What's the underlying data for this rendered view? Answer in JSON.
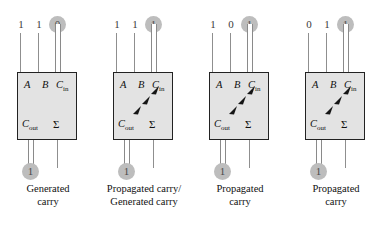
{
  "figure": {
    "colors": {
      "node_fill": "#bdbdbd",
      "box_fill": "#e3e3e3",
      "box_border": "#222222",
      "wire": "#8f8f8f",
      "text": "#111111"
    },
    "ports": {
      "a": "A",
      "b": "B",
      "cin_main": "C",
      "cin_sub": "in",
      "cout_main": "C",
      "cout_sub": "out",
      "sum": "Σ"
    },
    "cells": [
      {
        "id": "cell-1",
        "inputs": {
          "a": "1",
          "b": "1",
          "carry_in": "0"
        },
        "carry_out": "1",
        "has_propagation_arrow": false,
        "caption": "Generated\ncarry"
      },
      {
        "id": "cell-2",
        "inputs": {
          "a": "1",
          "b": "1",
          "carry_in": "1"
        },
        "carry_out": "1",
        "has_propagation_arrow": true,
        "caption": "Propagated carry/\nGenerated carry"
      },
      {
        "id": "cell-3",
        "inputs": {
          "a": "1",
          "b": "0",
          "carry_in": "1"
        },
        "carry_out": "1",
        "has_propagation_arrow": true,
        "caption": "Propagated\ncarry"
      },
      {
        "id": "cell-4",
        "inputs": {
          "a": "0",
          "b": "1",
          "carry_in": "1"
        },
        "carry_out": "1",
        "has_propagation_arrow": true,
        "caption": "Propagated\ncarry"
      }
    ]
  }
}
